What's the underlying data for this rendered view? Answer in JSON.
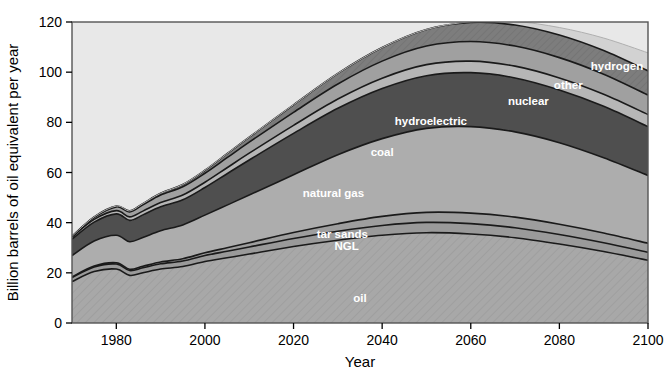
{
  "chart_data": {
    "type": "area",
    "stacked": true,
    "title": "",
    "xlabel": "Year",
    "ylabel": "Billion barrels of oil equivalent per year",
    "xlim": [
      1970,
      2100
    ],
    "ylim": [
      0,
      120
    ],
    "xticks": [
      1980,
      2000,
      2020,
      2040,
      2060,
      2080,
      2100
    ],
    "yticks": [
      0,
      20,
      40,
      60,
      80,
      100,
      120
    ],
    "grid": false,
    "legend_position": "inline-labels",
    "x": [
      1970,
      1975,
      1980,
      1983,
      1986,
      1990,
      1995,
      2000,
      2005,
      2010,
      2020,
      2030,
      2040,
      2050,
      2060,
      2070,
      2080,
      2090,
      2100
    ],
    "series": [
      {
        "name": "oil",
        "label": "oil",
        "color": "#a8a8a8",
        "values": [
          16.5,
          20.5,
          21.5,
          19.0,
          20.0,
          21.5,
          22.5,
          24.5,
          26.0,
          27.5,
          30.5,
          33.0,
          35.0,
          36.0,
          35.5,
          34.0,
          31.5,
          28.5,
          25.0
        ]
      },
      {
        "name": "NGL",
        "label": "NGL",
        "color": "#9a9a9a",
        "values": [
          1.6,
          1.8,
          2.0,
          1.9,
          2.0,
          2.1,
          2.2,
          2.4,
          2.6,
          2.8,
          3.2,
          3.6,
          3.9,
          4.1,
          4.1,
          4.0,
          3.8,
          3.5,
          3.2
        ]
      },
      {
        "name": "tar sands",
        "label": "tar sands",
        "color": "#9e9e9e",
        "values": [
          0.3,
          0.4,
          0.5,
          0.5,
          0.6,
          0.7,
          0.9,
          1.1,
          1.4,
          1.7,
          2.4,
          3.0,
          3.6,
          4.0,
          4.2,
          4.2,
          4.1,
          3.9,
          3.6
        ]
      },
      {
        "name": "natural gas",
        "label": "natural gas",
        "color": "#adadad",
        "values": [
          8.5,
          10.0,
          11.0,
          11.0,
          11.5,
          12.5,
          13.5,
          15.0,
          17.0,
          19.0,
          23.0,
          27.5,
          31.0,
          33.5,
          34.5,
          34.0,
          32.5,
          30.0,
          27.0
        ]
      },
      {
        "name": "coal",
        "label": "coal",
        "color": "#4f4f4f",
        "values": [
          6.5,
          7.5,
          8.5,
          8.5,
          9.0,
          9.5,
          10.0,
          11.0,
          12.5,
          14.0,
          16.5,
          18.5,
          20.0,
          21.0,
          21.5,
          21.5,
          21.0,
          20.5,
          19.5
        ]
      },
      {
        "name": "hydroelectric",
        "label": "hydroelectric",
        "color": "#b6b6b6",
        "values": [
          0.9,
          1.1,
          1.3,
          1.4,
          1.5,
          1.7,
          1.9,
          2.1,
          2.4,
          2.7,
          3.2,
          3.7,
          4.1,
          4.4,
          4.6,
          4.7,
          4.8,
          4.8,
          4.8
        ]
      },
      {
        "name": "nuclear",
        "label": "nuclear",
        "color": "#a0a0a0",
        "values": [
          0.2,
          0.8,
          1.5,
          2.0,
          2.5,
          3.0,
          3.3,
          3.6,
          4.0,
          4.4,
          5.2,
          6.0,
          6.8,
          7.4,
          7.8,
          8.0,
          8.1,
          8.0,
          7.8
        ]
      },
      {
        "name": "other",
        "label": "other",
        "color": "#7d7d7d",
        "values": [
          0.1,
          0.2,
          0.3,
          0.4,
          0.5,
          0.7,
          0.9,
          1.2,
          1.6,
          2.0,
          3.0,
          4.2,
          5.4,
          6.6,
          7.6,
          8.4,
          9.0,
          9.4,
          9.6
        ]
      },
      {
        "name": "hydrogen",
        "label": "hydrogen",
        "color": "#d2d2d2",
        "values": [
          0,
          0,
          0,
          0,
          0,
          0,
          0,
          0,
          0,
          0,
          0,
          0,
          0,
          0,
          0.3,
          1.4,
          3.0,
          5.0,
          7.2
        ]
      }
    ],
    "background_color": "#e8e8e8",
    "label_positions": [
      {
        "name": "oil",
        "x": 2035,
        "y": 10
      },
      {
        "name": "NGL",
        "x": 2032,
        "y": 30.5
      },
      {
        "name": "tar sands",
        "x": 2031,
        "y": 35.5
      },
      {
        "name": "natural gas",
        "x": 2029,
        "y": 52
      },
      {
        "name": "coal",
        "x": 2040,
        "y": 68
      },
      {
        "name": "hydroelectric",
        "x": 2051,
        "y": 80.5
      },
      {
        "name": "nuclear",
        "x": 2073,
        "y": 88.5
      },
      {
        "name": "other",
        "x": 2082,
        "y": 95
      },
      {
        "name": "hydrogen",
        "x": 2093,
        "y": 102.5
      }
    ]
  }
}
